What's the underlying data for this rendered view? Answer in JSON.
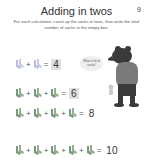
{
  "header": {
    "title": "Adding in twos",
    "page_number": "9",
    "instructions": "For each calculation, count up the socks in twos, then write the total number of socks in the empty box."
  },
  "speech_bubble": {
    "text": "What a lot of socks!"
  },
  "colors": {
    "sock_row1": "#b8bfe0",
    "sock_other": "#7a9a7a",
    "answer_box": "#e0e0e0"
  },
  "rows": [
    {
      "socks": 2,
      "plus": "+",
      "equals": "=",
      "answer": "4",
      "boxed": true,
      "sock_icon": "sock-pair-blue-icon"
    },
    {
      "socks": 3,
      "plus": "+",
      "equals": "=",
      "answer": "6",
      "boxed": true,
      "sock_icon": "sock-pair-green-icon"
    },
    {
      "socks": 4,
      "plus": "+",
      "equals": "=",
      "answer": "8",
      "boxed": false,
      "sock_icon": "sock-pair-green-icon"
    },
    {
      "socks": 5,
      "plus": "+",
      "equals": "=",
      "answer": "10",
      "boxed": false,
      "sock_icon": "sock-pair-green-icon"
    }
  ]
}
